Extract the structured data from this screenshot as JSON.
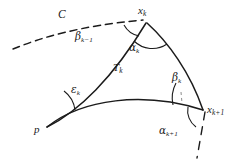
{
  "figure": {
    "background_color": "#ffffff",
    "stroke_color": "#1b1b1b",
    "width": 243,
    "height": 163
  },
  "labels": {
    "curve_c": "C",
    "vertex_xk": "x",
    "vertex_xk_sub": "k",
    "vertex_xkp1": "x",
    "vertex_xkp1_sub": "k+1",
    "vertex_p": "p",
    "region_tk": "T",
    "region_tk_sub": "k",
    "angle_beta_km1": "β",
    "angle_beta_km1_sub": "k−1",
    "angle_alpha_k": "α",
    "angle_alpha_k_sub": "k",
    "angle_epsilon_k": "ε",
    "angle_epsilon_k_sub": "k",
    "angle_beta_k": "β",
    "angle_beta_k_sub": "k",
    "angle_alpha_kp1": "α",
    "angle_alpha_kp1_sub": "k+1"
  },
  "geometry": {
    "vertex_p": [
      47,
      127
    ],
    "vertex_xk": [
      147,
      22
    ],
    "vertex_xkp1": [
      203,
      110
    ],
    "edge_p_xk": "concave arc bulging right",
    "edge_xk_xkp1": "concave arc bulging right",
    "edge_p_xkp1": "convex arc bulging up",
    "dashed_curve_c": "arc entering from lower-left to x_k",
    "dashed_tangent": "short dashed ray descending from x_{k+1}"
  }
}
